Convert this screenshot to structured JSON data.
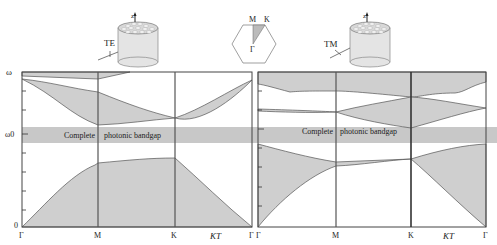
{
  "figure": {
    "left_panel": {
      "polarization": "TE",
      "axis_symbol_omega": "ω",
      "axis_symbol_omega0": "ω0",
      "axis_zero": "0",
      "x_ticks": [
        "Γ",
        "M",
        "K",
        "Γ"
      ],
      "k_label": "KT",
      "gap_label_1": "Complete",
      "gap_label_2": "photonic bandgap",
      "crystal_axis": "z"
    },
    "right_panel": {
      "polarization": "TM",
      "x_ticks": [
        "Γ",
        "M",
        "K",
        "Γ"
      ],
      "k_label": "KT",
      "gap_label_1": "Complete",
      "gap_label_2": "photonic bandgap",
      "crystal_axis": "z"
    },
    "brillouin_zone": {
      "points": [
        "M",
        "K",
        "Γ"
      ]
    },
    "colors": {
      "band_fill": "#cfcfcf",
      "gap_fill": "#c8c8c8",
      "line": "#555555"
    }
  }
}
